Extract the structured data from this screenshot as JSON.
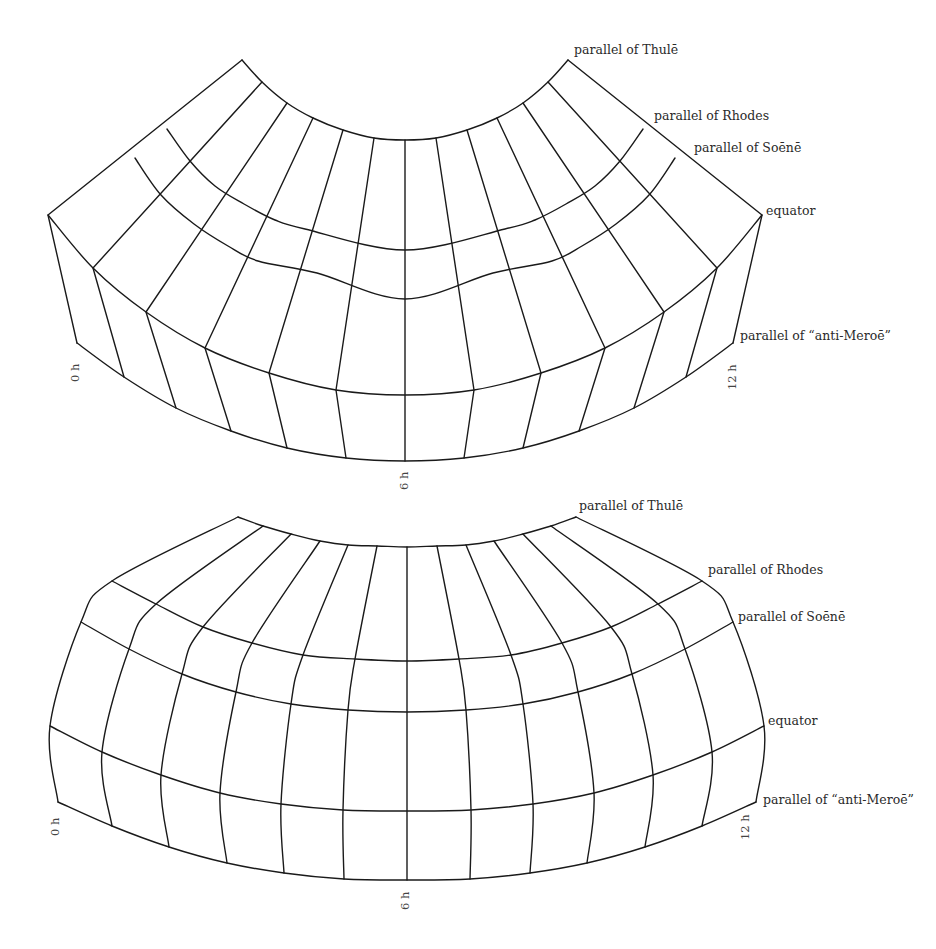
{
  "figure": {
    "line_color": "#1a1a1a"
  },
  "chart_data": [
    {
      "type": "diagram",
      "name": "top-projection",
      "mirror_center_x": 405,
      "meridian_count": 13,
      "parallels": [
        "parallel of Thulē",
        "parallel of Rhodes",
        "parallel of Soēnē",
        "equator",
        "parallel of “anti-Meroē”"
      ],
      "left_half_points": {
        "thule": [
          [
            242,
            60
          ],
          [
            262,
            82
          ],
          [
            287,
            103
          ],
          [
            313,
            118
          ],
          [
            343,
            130
          ],
          [
            374,
            138
          ],
          [
            405,
            140
          ]
        ],
        "rhodes": [
          [
            167,
            129
          ],
          [
            190,
            161
          ],
          [
            215,
            186
          ],
          [
            244,
            204
          ],
          [
            275,
            220
          ],
          [
            305,
            229
          ],
          [
            405,
            250
          ]
        ],
        "soene": [
          [
            135,
            158
          ],
          [
            161,
            195
          ],
          [
            194,
            224
          ],
          [
            228,
            246
          ],
          [
            258,
            261
          ],
          [
            317,
            273
          ],
          [
            405,
            299
          ]
        ],
        "equator": [
          [
            48,
            215
          ],
          [
            93,
            268
          ],
          [
            146,
            312
          ],
          [
            205,
            348
          ],
          [
            269,
            373
          ],
          [
            336,
            390
          ],
          [
            405,
            395
          ]
        ],
        "anti_meroe": [
          [
            77,
            343
          ],
          [
            124,
            377
          ],
          [
            176,
            408
          ],
          [
            231,
            431
          ],
          [
            287,
            448
          ],
          [
            346,
            458
          ],
          [
            405,
            461
          ]
        ]
      },
      "labels": {
        "thule": {
          "text": "parallel of Thulē",
          "x": 574,
          "y": 44
        },
        "rhodes": {
          "text": "parallel of Rhodes",
          "x": 654,
          "y": 110
        },
        "soene": {
          "text": "parallel of Soēnē",
          "x": 694,
          "y": 142
        },
        "equator": {
          "text": "equator",
          "x": 766,
          "y": 205
        },
        "anti_meroe": {
          "text": "parallel of “anti-Meroē”",
          "x": 740,
          "y": 131
        }
      },
      "hour_labels": [
        {
          "text": "0 h",
          "x": 70,
          "y": 382
        },
        {
          "text": "6 h",
          "x": 399,
          "y": 490
        },
        {
          "text": "12 h",
          "x": 727,
          "y": 390
        }
      ]
    },
    {
      "type": "diagram",
      "name": "bottom-projection",
      "mirror_center_x": 407,
      "meridian_count": 13,
      "parallels": [
        "parallel of Thulē",
        "parallel of Rhodes",
        "parallel of Soēnē",
        "equator",
        "parallel of “anti-Meroē”"
      ],
      "left_half_points": {
        "thule": [
          [
            238,
            517
          ],
          [
            263,
            526
          ],
          [
            291,
            534
          ],
          [
            320,
            541
          ],
          [
            348,
            545
          ],
          [
            377,
            546
          ],
          [
            407,
            547
          ]
        ],
        "rhodes": [
          [
            112,
            581
          ],
          [
            156,
            604
          ],
          [
            203,
            627
          ],
          [
            252,
            643
          ],
          [
            303,
            655
          ],
          [
            355,
            659
          ],
          [
            407,
            661
          ]
        ],
        "soene": [
          [
            81,
            622
          ],
          [
            129,
            649
          ],
          [
            182,
            674
          ],
          [
            236,
            692
          ],
          [
            291,
            704
          ],
          [
            348,
            710
          ],
          [
            407,
            712
          ]
        ],
        "equator": [
          [
            50,
            726
          ],
          [
            102,
            752
          ],
          [
            161,
            775
          ],
          [
            220,
            793
          ],
          [
            281,
            804
          ],
          [
            343,
            810
          ],
          [
            407,
            811
          ]
        ],
        "anti_meroe": [
          [
            58,
            802
          ],
          [
            112,
            826
          ],
          [
            169,
            847
          ],
          [
            227,
            863
          ],
          [
            284,
            873
          ],
          [
            344,
            879
          ],
          [
            407,
            880
          ]
        ]
      },
      "labels": {
        "thule": {
          "text": "parallel of Thulē",
          "x": 579,
          "y": 500
        },
        "rhodes": {
          "text": "parallel of Rhodes",
          "x": 708,
          "y": 564
        },
        "soene": {
          "text": "parallel of Soēnē",
          "x": 738,
          "y": 611
        },
        "equator": {
          "text": "equator",
          "x": 768,
          "y": 715
        },
        "anti_meroe": {
          "text": "parallel of “anti-Meroē”",
          "x": 763,
          "y": 794
        }
      },
      "hour_labels": [
        {
          "text": "0 h",
          "x": 50,
          "y": 836
        },
        {
          "text": "6 h",
          "x": 400,
          "y": 910
        },
        {
          "text": "12 h",
          "x": 740,
          "y": 840
        }
      ]
    }
  ]
}
